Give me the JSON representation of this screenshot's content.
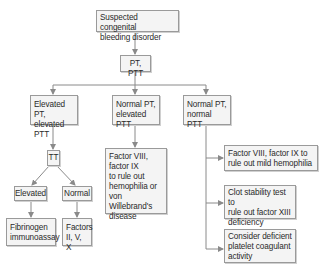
{
  "nodes": {
    "root": "Suspected congenital\nbleeding disorder",
    "screen": "PT, PTT",
    "elev_elev": "Elevated PT,\nelevated PTT",
    "norm_elev": "Normal PT,\nelevated PTT",
    "norm_norm": "Normal PT,\nnormal PTT",
    "tt": "TT",
    "tt_elevated": "Elevated",
    "tt_normal": "Normal",
    "fibrinogen": "Fibrinogen\nimmunoassay",
    "factors": "Factors\nII, V, X",
    "factor_viii_ix": "Factor VIII,\nfactor IX\nto rule out\nhemophilia or\nvon Willebrand's\ndisease",
    "mild_hemophilia": "Factor VIII, factor IX to\nrule out mild hemophilia",
    "clot_stability": "Clot stability test to\nrule out factor XIII\ndeficiency",
    "platelet": "Consider deficient\nplatelet coagulant\nactivity"
  },
  "colors": {
    "line": "#8a8a8a",
    "box_fill": "#f4f4f4",
    "box_border": "#9a9a9a"
  }
}
